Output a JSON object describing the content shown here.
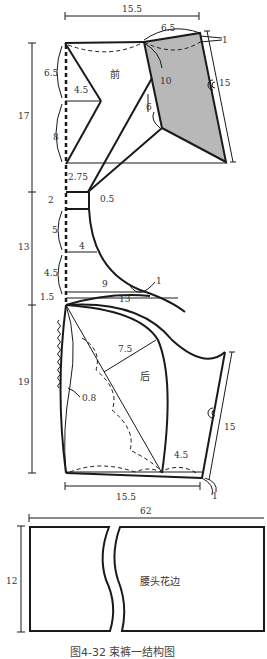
{
  "figure": {
    "caption": "图4-32  束裤一结构图",
    "front_piece": {
      "label": "前",
      "dims": {
        "top_width": "15.5",
        "top_segment": "6.5",
        "offset_right": "1",
        "side_length": "15",
        "dart_length": "10",
        "dart_inner": "6",
        "left_upper": "6.5",
        "dart_width": "4.5",
        "left_lower": "8",
        "total_height": "17",
        "crotch": "2.75",
        "crotch_offset": "0.5"
      }
    },
    "crotch_section": {
      "dims": {
        "total_height": "13",
        "seg_a": "2",
        "seg_b": "5",
        "width_mid": "4",
        "seg_c": "4.5",
        "seg_d": "1.5",
        "curve_width": "9",
        "curve_offset": "1",
        "base_width": "13"
      }
    },
    "back_piece": {
      "label": "后",
      "dims": {
        "total_height": "19",
        "radius": "7.5",
        "ease": "0.8",
        "side_length": "15",
        "bottom_segment": "4.5",
        "bottom_width": "15.5",
        "bottom_offset": "1"
      }
    },
    "waistband": {
      "label": "腰头花边",
      "width": "62",
      "height": "12"
    }
  }
}
